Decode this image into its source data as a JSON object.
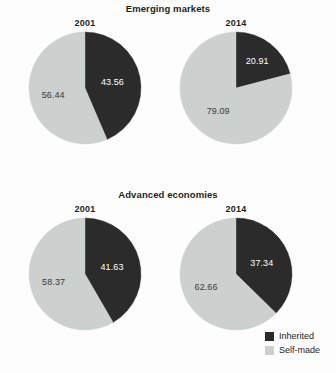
{
  "colors": {
    "inherited": "#2b2b2b",
    "self_made": "#ccd0cf",
    "background": "#fdfdfd",
    "text": "#231f20",
    "label_on_dark": "#ffffff",
    "label_on_light": "#3a3a3a"
  },
  "legend": {
    "items": [
      {
        "label": "Inherited",
        "color": "#2b2b2b"
      },
      {
        "label": "Self-made",
        "color": "#ccd0cf"
      }
    ]
  },
  "sections": [
    {
      "id": "emerging",
      "title": "Emerging markets",
      "charts": [
        {
          "year": "2001",
          "inherited": 43.56,
          "self_made": 56.44,
          "inherited_label": "43.56",
          "self_made_label": "56.44"
        },
        {
          "year": "2014",
          "inherited": 20.91,
          "self_made": 79.09,
          "inherited_label": "20.91",
          "self_made_label": "79.09"
        }
      ]
    },
    {
      "id": "advanced",
      "title": "Advanced economies",
      "charts": [
        {
          "year": "2001",
          "inherited": 41.63,
          "self_made": 58.37,
          "inherited_label": "41.63",
          "self_made_label": "58.37"
        },
        {
          "year": "2014",
          "inherited": 37.34,
          "self_made": 62.66,
          "inherited_label": "37.34",
          "self_made_label": "62.66"
        }
      ]
    }
  ],
  "chart_data": [
    {
      "type": "pie",
      "title": "Emerging markets",
      "subtitle": "2001",
      "labels": [
        "Inherited",
        "Self-made"
      ],
      "values": [
        43.56,
        56.44
      ],
      "colors": [
        "#2b2b2b",
        "#ccd0cf"
      ],
      "start_angle": 0,
      "direction": "clockwise",
      "units": "percent",
      "legend_position": "bottom-right"
    },
    {
      "type": "pie",
      "title": "Emerging markets",
      "subtitle": "2014",
      "labels": [
        "Inherited",
        "Self-made"
      ],
      "values": [
        20.91,
        79.09
      ],
      "colors": [
        "#2b2b2b",
        "#ccd0cf"
      ],
      "start_angle": 0,
      "direction": "clockwise",
      "units": "percent",
      "legend_position": "bottom-right"
    },
    {
      "type": "pie",
      "title": "Advanced economies",
      "subtitle": "2001",
      "labels": [
        "Inherited",
        "Self-made"
      ],
      "values": [
        41.63,
        58.37
      ],
      "colors": [
        "#2b2b2b",
        "#ccd0cf"
      ],
      "start_angle": 0,
      "direction": "clockwise",
      "units": "percent",
      "legend_position": "bottom-right"
    },
    {
      "type": "pie",
      "title": "Advanced economies",
      "subtitle": "2014",
      "labels": [
        "Inherited",
        "Self-made"
      ],
      "values": [
        37.34,
        62.66
      ],
      "colors": [
        "#2b2b2b",
        "#ccd0cf"
      ],
      "start_angle": 0,
      "direction": "clockwise",
      "units": "percent",
      "legend_position": "bottom-right"
    }
  ]
}
